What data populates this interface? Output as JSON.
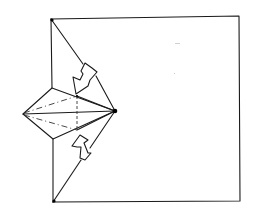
{
  "diagram": {
    "type": "origami-fold-step",
    "colors": {
      "line": "#1a1a1a",
      "background": "#ffffff"
    },
    "elements": {
      "square": {
        "points": [
          [
            51,
            19
          ],
          [
            239,
            16
          ],
          [
            240,
            201
          ],
          [
            53,
            202
          ]
        ]
      },
      "kite": {
        "left_tip": [
          23,
          114
        ],
        "top": [
          52,
          88
        ],
        "right_tip": [
          115,
          111
        ],
        "bottom": [
          53,
          139
        ]
      },
      "crease_lines": [
        {
          "from": [
            51,
            19
          ],
          "to": [
            115,
            111
          ],
          "style": "solid"
        },
        {
          "from": [
            53,
            202
          ],
          "to": [
            115,
            111
          ],
          "style": "solid"
        },
        {
          "from": [
            23,
            114
          ],
          "to": [
            115,
            111
          ],
          "style": "solid"
        }
      ],
      "valley_folds": [
        {
          "from": [
            23,
            114
          ],
          "to": [
            77,
            96
          ],
          "style": "dash-dot"
        },
        {
          "from": [
            23,
            114
          ],
          "to": [
            77,
            130
          ],
          "style": "dash-dot"
        }
      ],
      "hidden_edge": {
        "from": [
          77,
          96
        ],
        "to": [
          77,
          130
        ],
        "style": "dashed"
      },
      "arrows": [
        {
          "name": "upper-fold-arrow",
          "direction": "down-left"
        },
        {
          "name": "lower-fold-arrow",
          "direction": "up"
        }
      ],
      "reference_dots": [
        [
          51,
          19
        ],
        [
          53,
          202
        ],
        [
          115,
          111
        ]
      ]
    }
  }
}
